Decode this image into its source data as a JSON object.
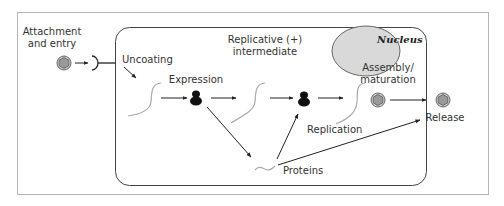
{
  "diagram": {
    "title_label": "Nucleus",
    "labels": {
      "attachment_line1": "Attachment",
      "attachment_line2": "and entry",
      "uncoating": "Uncoating",
      "expression": "Expression",
      "replicative_line1": "Replicative (+)",
      "replicative_line2": "intermediate",
      "assembly_line1": "Assembly/",
      "assembly_line2": "maturation",
      "replication": "Replication",
      "proteins": "Proteins",
      "release": "Release"
    },
    "colors": {
      "frame": "#b5b5b5",
      "cell_border": "#444444",
      "nucleus_fill": "#d9d9d9",
      "nucleus_stroke": "#666666",
      "virion_fill": "#9a9a9a",
      "rna_strand": "#aaaaaa",
      "ribosome": "#111111",
      "arrow": "#222222"
    }
  }
}
